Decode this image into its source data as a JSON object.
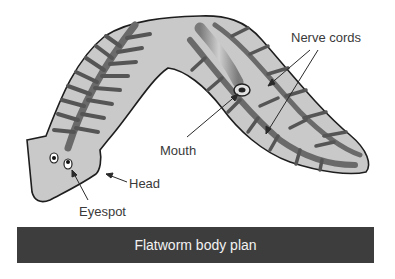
{
  "diagram": {
    "subject": "flatworm",
    "labels": {
      "nerve_cords": "Nerve cords",
      "mouth": "Mouth",
      "head": "Head",
      "eyespot": "Eyespot"
    }
  },
  "caption": {
    "text": "Flatworm body plan"
  },
  "colors": {
    "body_fill": "#c9c9c9",
    "outline": "#1e1e1e",
    "gut": "#5e5e5e",
    "caption_bg": "#3d3d3d",
    "caption_text": "#f2f2f2"
  }
}
